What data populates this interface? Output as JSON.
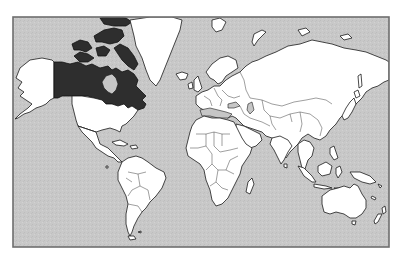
{
  "map": {
    "type": "world-political-outline",
    "projection": "mercator",
    "highlighted_country": "Canada",
    "colors": {
      "background": "#ffffff",
      "ocean": "#c8c8c8",
      "land": "#ffffff",
      "highlight": "#2e2e2e",
      "outline": "#1a1a1a",
      "frame": "#6e6e6e"
    },
    "frame": {
      "x": 13,
      "y": 17,
      "width": 376,
      "height": 230
    },
    "regions": [
      "canada",
      "canadian-arctic-archipelago",
      "alaska",
      "greenland",
      "united-states",
      "mexico-central-america",
      "caribbean",
      "south-america",
      "iceland",
      "europe",
      "scandinavia",
      "british-isles",
      "africa",
      "madagascar",
      "russia-asia",
      "arabian-peninsula",
      "india",
      "southeast-asia",
      "japan",
      "indonesia",
      "new-guinea",
      "australia",
      "new-zealand",
      "svalbard",
      "novaya-zemlya"
    ]
  }
}
